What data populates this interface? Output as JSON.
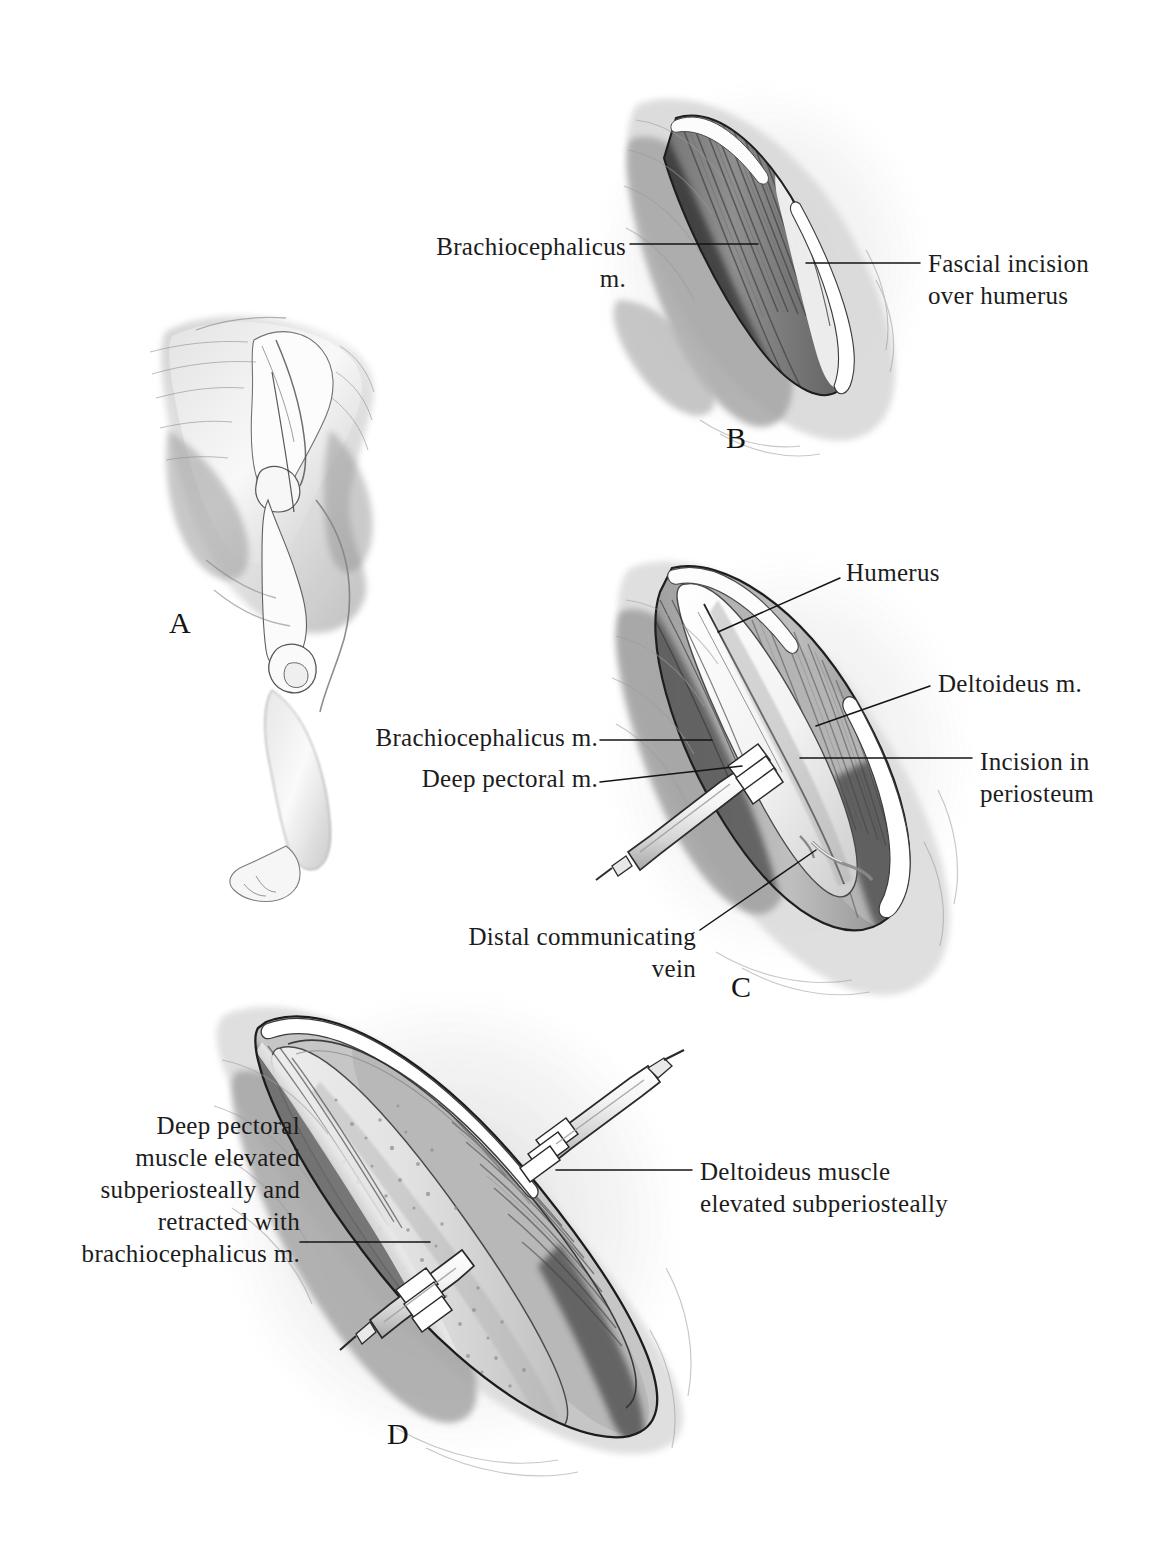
{
  "figure": {
    "background_color": "#ffffff",
    "ink_color": "#1c1c1c",
    "medium": "grayscale wash and pencil anatomical illustration",
    "panel_count": 4
  },
  "panels": {
    "a": {
      "letter": "A",
      "subject": "Lateral view of canine forelimb and shoulder showing skin incision line over the humerus"
    },
    "b": {
      "letter": "B",
      "subject": "Superficial exposure: skin retracted, elliptical wound with brachiocephalicus muscle and fascial incision"
    },
    "c": {
      "letter": "C",
      "subject": "Deeper exposure: humerus, deltoideus muscle, periosteal incision, retractor on deep pectoral muscle"
    },
    "d": {
      "letter": "D",
      "subject": "Full exposure: humeral shaft with deltoideus and deep pectoral muscles elevated subperiosteally and held by two Senn retractors"
    }
  },
  "labels": {
    "b_brachiocephalicus": "Brachiocephalicus  m.",
    "b_fascial_incision": "Fascial  incision\nover  humerus",
    "c_humerus": "Humerus",
    "c_deltoideus": "Deltoideus  m.",
    "c_incision_periosteum": "Incision  in\nperiosteum",
    "c_brachiocephalicus": "Brachiocephalicus  m.",
    "c_deep_pectoral": "Deep  pectoral  m.",
    "c_distal_vein": "Distal  communicating\nvein",
    "d_deep_pectoral": "Deep  pectoral\nmuscle  elevated\nsubperiosteally  and\nretracted  with\nbrachiocephalicus  m.",
    "d_deltoideus": "Deltoideus  muscle\nelevated  subperiosteally"
  }
}
